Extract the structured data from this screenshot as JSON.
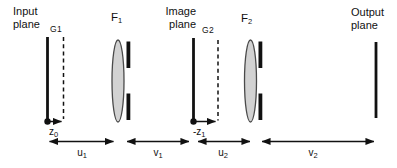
{
  "diagram": {
    "colors": {
      "line": "#111111",
      "lens_fill": "#d2d2d2",
      "lens_stroke": "#4a4a4a",
      "background": "#ffffff"
    },
    "labels": {
      "input_plane": {
        "line1": "Input",
        "line2": "plane"
      },
      "g1": "G1",
      "f1": {
        "base": "F",
        "sub": "1"
      },
      "image_plane": {
        "line1": "Image",
        "line2": "plane"
      },
      "g2": "G2",
      "f2": {
        "base": "F",
        "sub": "2"
      },
      "output_plane": {
        "line1": "Output",
        "line2": "plane"
      },
      "z0": {
        "base": "z",
        "sub": "0"
      },
      "neg_z1": {
        "base": "-z",
        "sub": "1"
      },
      "u1": {
        "base": "u",
        "sub": "1"
      },
      "v1": {
        "base": "v",
        "sub": "1"
      },
      "u2": {
        "base": "u",
        "sub": "2"
      },
      "v2": {
        "base": "v",
        "sub": "2"
      }
    }
  }
}
